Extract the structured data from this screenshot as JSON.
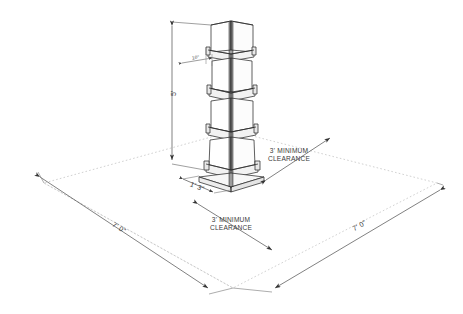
{
  "drawing": {
    "title": "Tower clearance plan",
    "type": "isometric-technical-drawing",
    "background_color": "#ffffff",
    "line_color": "#2b2b2b",
    "dim_line_color": "#555555",
    "dotted_color": "#b4b4b4",
    "text_color": "#3a3a3a"
  },
  "dimensions": {
    "tower_height": "5'",
    "tower_base_width": "1' 3\"",
    "ledge_detail": "10\"",
    "pad_width_left": "7' 0\"",
    "pad_width_right": "7' 0\""
  },
  "annotations": {
    "clearance_right": {
      "line1": "3' MINIMUM",
      "line2": "CLEARANCE"
    },
    "clearance_front": {
      "line1": "3' MINIMUM",
      "line2": "CLEARANCE"
    }
  },
  "object": {
    "name": "tapered-tower",
    "sections": 4,
    "ledge_bands": 4,
    "base_plate": true
  }
}
